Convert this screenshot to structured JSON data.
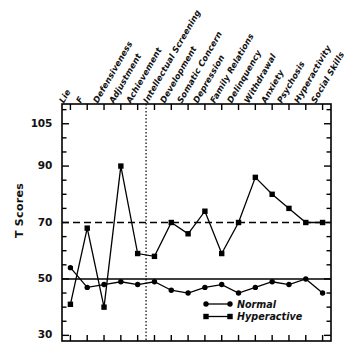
{
  "chart_data": {
    "type": "line",
    "title": "",
    "xlabel": "",
    "ylabel": "T Scores",
    "ylim": [
      28,
      112
    ],
    "yticks_labeled": [
      105,
      90,
      70,
      50,
      30
    ],
    "ytick_labels": [
      "105",
      "90",
      "70",
      "50",
      "30"
    ],
    "yticks_minor_step": 5,
    "grid": false,
    "legend_position": "bottom-right",
    "reference_lines": [
      {
        "name": "mean-line",
        "y": 50,
        "style": "solid"
      },
      {
        "name": "clinical-cutoff-line",
        "y": 70,
        "style": "dashed"
      }
    ],
    "vertical_divider": {
      "name": "validity-clinical-divider",
      "after_category_index": 4,
      "style": "dotted"
    },
    "categories": [
      "Lie",
      "F",
      "Defensiveness",
      "Adjustment",
      "Achievement",
      "Intellectual Screening",
      "Development",
      "Somatic Concern",
      "Depression",
      "Family Relations",
      "Delinquency",
      "Withdrawal",
      "Anxiety",
      "Psychosis",
      "Hyperactivity",
      "Social Skills"
    ],
    "series": [
      {
        "name": "Normal",
        "marker": "circle",
        "values": [
          54,
          47,
          48,
          49,
          48,
          49,
          46,
          45,
          47,
          48,
          45,
          47,
          49,
          48,
          50,
          45
        ]
      },
      {
        "name": "Hyperactive",
        "marker": "square",
        "values": [
          41,
          68,
          40,
          90,
          59,
          58,
          70,
          66,
          74,
          59,
          70,
          86,
          80,
          75,
          70,
          70
        ]
      }
    ]
  },
  "axis": {
    "y_title": "T Scores"
  },
  "legend": {
    "items": [
      {
        "label": "Normal",
        "marker": "circle"
      },
      {
        "label": "Hyperactive",
        "marker": "square"
      }
    ]
  },
  "colors": {
    "ink": "#000000",
    "background": "#ffffff"
  }
}
